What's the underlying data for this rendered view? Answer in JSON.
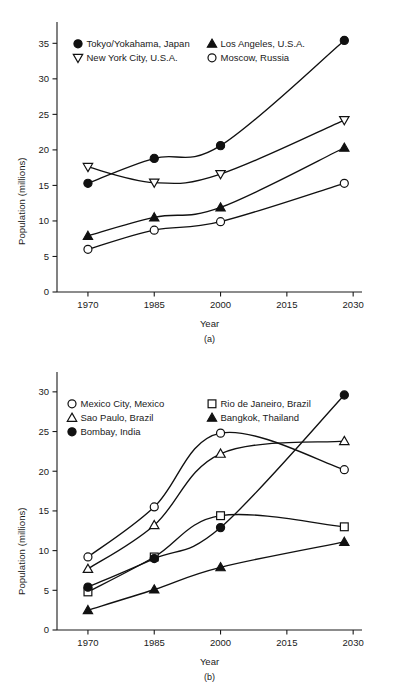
{
  "figure": {
    "background": "#ffffff",
    "ink_color": "#111111"
  },
  "charts": [
    {
      "panel_id": "a",
      "caption": "(a)",
      "xlabel": "Year",
      "ylabel": "Population (millions)"
    },
    {
      "panel_id": "b",
      "caption": "(b)",
      "xlabel": "Year",
      "ylabel": "Population (millions)"
    }
  ],
  "chart_data": [
    {
      "type": "line",
      "title": "",
      "panel": "(a)",
      "xlabel": "Year",
      "ylabel": "Population (millions)",
      "x": [
        1970,
        1985,
        2000,
        2028
      ],
      "xticks": [
        1970,
        1985,
        2000,
        2015,
        2030
      ],
      "xtick_labels": [
        "1970",
        "1985",
        "2000",
        "2015",
        "2030"
      ],
      "xlim": [
        1963,
        2032
      ],
      "yticks": [
        0,
        5,
        10,
        15,
        20,
        25,
        30,
        35
      ],
      "ytick_labels": [
        "0",
        "5",
        "10",
        "15",
        "20",
        "25",
        "30",
        "35"
      ],
      "ylim": [
        0,
        38
      ],
      "grid": false,
      "legend_position": "upper-left-inside",
      "series": [
        {
          "name": "Tokyo/Yokahama, Japan",
          "marker": "filled-circle",
          "values": [
            15.3,
            18.8,
            20.6,
            35.4
          ]
        },
        {
          "name": "Los Angeles, U.S.A.",
          "marker": "filled-triangle-up",
          "values": [
            7.9,
            10.5,
            11.9,
            20.3
          ]
        },
        {
          "name": "New York City, U.S.A.",
          "marker": "open-triangle-down",
          "values": [
            17.6,
            15.4,
            16.6,
            24.2
          ]
        },
        {
          "name": "Moscow, Russia",
          "marker": "open-circle",
          "values": [
            6.0,
            8.7,
            9.9,
            15.3
          ]
        }
      ]
    },
    {
      "type": "line",
      "title": "",
      "panel": "(b)",
      "xlabel": "Year",
      "ylabel": "Population (millions)",
      "x": [
        1970,
        1985,
        2000,
        2028
      ],
      "xticks": [
        1970,
        1985,
        2000,
        2015,
        2030
      ],
      "xtick_labels": [
        "1970",
        "1985",
        "2000",
        "2015",
        "2030"
      ],
      "xlim": [
        1963,
        2032
      ],
      "yticks": [
        0,
        5,
        10,
        15,
        20,
        25,
        30
      ],
      "ytick_labels": [
        "0",
        "5",
        "10",
        "15",
        "20",
        "25",
        "30"
      ],
      "ylim": [
        0,
        32.5
      ],
      "grid": false,
      "legend_position": "upper-left-inside",
      "series": [
        {
          "name": "Mexico City, Mexico",
          "marker": "open-circle",
          "values": [
            9.2,
            15.5,
            24.8,
            20.2
          ]
        },
        {
          "name": "Rio de Janeiro, Brazil",
          "marker": "open-square",
          "values": [
            4.8,
            9.2,
            14.4,
            13.0
          ]
        },
        {
          "name": "Sao Paulo, Brazil",
          "marker": "open-triangle-up",
          "values": [
            7.7,
            13.2,
            22.2,
            23.8
          ]
        },
        {
          "name": "Bangkok, Thailand",
          "marker": "filled-triangle-up",
          "values": [
            2.5,
            5.1,
            7.9,
            11.1
          ]
        },
        {
          "name": "Bombay, India",
          "marker": "filled-circle",
          "values": [
            5.4,
            9.0,
            12.9,
            29.6
          ]
        }
      ]
    }
  ]
}
